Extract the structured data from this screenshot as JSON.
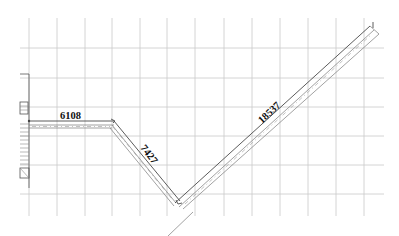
{
  "drawing": {
    "background": "#ffffff",
    "grid_color": "#c9c9c9",
    "line_color": "#7a7a7a",
    "text_color": "#111111",
    "grid": {
      "vertical_x": [
        29,
        57,
        85,
        112,
        140,
        167,
        195,
        224,
        252,
        280,
        308,
        336,
        364
      ],
      "horizontal_y": [
        48,
        78,
        107,
        136,
        165,
        194
      ],
      "x_extent": [
        20,
        384
      ],
      "y_extent": [
        18,
        216
      ]
    },
    "segments": [
      {
        "id": "seg-1",
        "label": "6108",
        "from": [
          29,
          121
        ],
        "to": [
          114,
          121
        ],
        "label_pos": [
          60,
          119
        ],
        "label_rotation": 0
      },
      {
        "id": "seg-2",
        "label": "7427",
        "from": [
          114,
          121
        ],
        "to": [
          180,
          205
        ],
        "label_pos": [
          143,
          155
        ],
        "label_rotation": 52
      },
      {
        "id": "seg-3",
        "label": "18537",
        "from": [
          180,
          205
        ],
        "to": [
          373,
          28
        ],
        "label_pos": [
          268,
          116
        ],
        "label_rotation": -43
      }
    ]
  }
}
